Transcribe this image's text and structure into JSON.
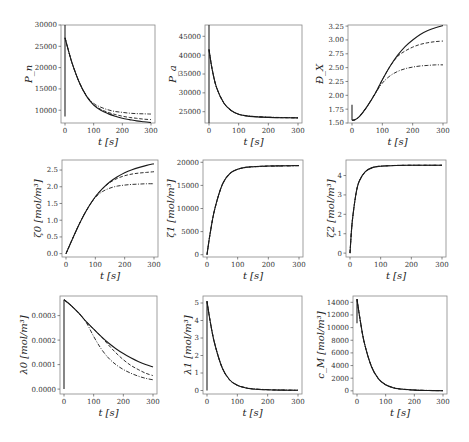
{
  "figure": {
    "caption_visible": "",
    "line_styles_legend": [
      "solid",
      "dashed",
      "dash-dot"
    ]
  },
  "chart_data": [
    {
      "type": "line",
      "panel": "row1-col1",
      "title": "",
      "xlabel": "t [s]",
      "ylabel": "P_n",
      "xlim": [
        0,
        300
      ],
      "ylim": [
        7000,
        30000
      ],
      "xticks": [
        0,
        100,
        200,
        300
      ],
      "yticks": [
        10000,
        15000,
        20000,
        25000,
        30000
      ],
      "grid": false,
      "initial_spike": [
        8500,
        30000
      ],
      "series": [
        {
          "name": "solid",
          "style": "solid",
          "x": [
            0,
            10,
            25,
            50,
            75,
            100,
            125,
            150,
            175,
            200,
            225,
            250,
            275,
            300
          ],
          "y": [
            27000,
            24500,
            21000,
            16500,
            13300,
            11200,
            10000,
            9200,
            8600,
            8100,
            7800,
            7500,
            7300,
            7100
          ]
        },
        {
          "name": "dashed",
          "style": "dashed",
          "x": [
            0,
            10,
            25,
            50,
            75,
            100,
            125,
            150,
            175,
            200,
            225,
            250,
            275,
            300
          ],
          "y": [
            27000,
            24500,
            21000,
            16500,
            13300,
            11300,
            10200,
            9500,
            9000,
            8600,
            8300,
            8100,
            7900,
            7800
          ]
        },
        {
          "name": "dash-dot",
          "style": "dashdot",
          "x": [
            0,
            10,
            25,
            50,
            75,
            100,
            125,
            150,
            175,
            200,
            225,
            250,
            275,
            300
          ],
          "y": [
            27000,
            24500,
            21000,
            16500,
            13400,
            11600,
            10700,
            10100,
            9700,
            9500,
            9300,
            9200,
            9150,
            9100
          ]
        }
      ]
    },
    {
      "type": "line",
      "panel": "row1-col2",
      "title": "",
      "xlabel": "t [s]",
      "ylabel": "P_a",
      "xlim": [
        0,
        300
      ],
      "ylim": [
        22000,
        48000
      ],
      "xticks": [
        0,
        100,
        200,
        300
      ],
      "yticks": [
        25000,
        30000,
        35000,
        40000,
        45000
      ],
      "grid": false,
      "initial_spike": [
        22000,
        48000
      ],
      "series": [
        {
          "name": "solid",
          "style": "solid",
          "x": [
            0,
            10,
            25,
            50,
            75,
            100,
            125,
            150,
            200,
            250,
            300
          ],
          "y": [
            41500,
            36500,
            31500,
            27300,
            25300,
            24300,
            23900,
            23700,
            23500,
            23400,
            23350
          ]
        },
        {
          "name": "dashed",
          "style": "dashed",
          "x": [
            0,
            10,
            25,
            50,
            75,
            100,
            125,
            150,
            200,
            250,
            300
          ],
          "y": [
            41500,
            36500,
            31500,
            27300,
            25300,
            24300,
            23900,
            23700,
            23500,
            23400,
            23350
          ]
        },
        {
          "name": "dash-dot",
          "style": "dashdot",
          "x": [
            0,
            10,
            25,
            50,
            75,
            100,
            125,
            150,
            200,
            250,
            300
          ],
          "y": [
            41500,
            36500,
            31500,
            27300,
            25300,
            24300,
            23950,
            23750,
            23550,
            23450,
            23400
          ]
        }
      ]
    },
    {
      "type": "line",
      "panel": "row1-col3",
      "title": "",
      "xlabel": "t [s]",
      "ylabel": "Đ_X",
      "xlim": [
        0,
        300
      ],
      "ylim": [
        1.5,
        3.27
      ],
      "xticks": [
        0,
        100,
        200,
        300
      ],
      "yticks": [
        1.5,
        1.75,
        2.0,
        2.25,
        2.5,
        2.75,
        3.0,
        3.25
      ],
      "grid": false,
      "initial_spike": [
        1.55,
        1.83
      ],
      "series": [
        {
          "name": "solid",
          "style": "solid",
          "x": [
            0,
            10,
            25,
            50,
            75,
            100,
            125,
            150,
            175,
            200,
            225,
            250,
            275,
            300
          ],
          "y": [
            1.55,
            1.56,
            1.62,
            1.8,
            2.02,
            2.28,
            2.52,
            2.72,
            2.88,
            3.0,
            3.1,
            3.17,
            3.22,
            3.26
          ]
        },
        {
          "name": "dashed",
          "style": "dashed",
          "x": [
            0,
            10,
            25,
            50,
            75,
            100,
            125,
            150,
            175,
            200,
            225,
            250,
            275,
            300
          ],
          "y": [
            1.55,
            1.56,
            1.62,
            1.8,
            2.02,
            2.28,
            2.52,
            2.7,
            2.8,
            2.87,
            2.92,
            2.95,
            2.97,
            2.98
          ]
        },
        {
          "name": "dash-dot",
          "style": "dashdot",
          "x": [
            0,
            10,
            25,
            50,
            75,
            100,
            125,
            150,
            175,
            200,
            225,
            250,
            275,
            300
          ],
          "y": [
            1.55,
            1.56,
            1.62,
            1.8,
            2.02,
            2.22,
            2.35,
            2.43,
            2.48,
            2.51,
            2.53,
            2.54,
            2.55,
            2.55
          ]
        }
      ]
    },
    {
      "type": "line",
      "panel": "row2-col1",
      "title": "",
      "xlabel": "t [s]",
      "ylabel": "ζ0 [mol/m³]",
      "xlim": [
        0,
        300
      ],
      "ylim": [
        -0.1,
        2.8
      ],
      "xticks": [
        0,
        100,
        200,
        300
      ],
      "yticks": [
        0.0,
        0.5,
        1.0,
        1.5,
        2.0,
        2.5
      ],
      "grid": false,
      "series": [
        {
          "name": "solid",
          "style": "solid",
          "x": [
            0,
            25,
            50,
            75,
            100,
            125,
            150,
            175,
            200,
            225,
            250,
            275,
            300
          ],
          "y": [
            0.0,
            0.5,
            0.97,
            1.37,
            1.7,
            1.95,
            2.15,
            2.3,
            2.42,
            2.51,
            2.58,
            2.64,
            2.69
          ]
        },
        {
          "name": "dashed",
          "style": "dashed",
          "x": [
            0,
            25,
            50,
            75,
            100,
            125,
            150,
            175,
            200,
            225,
            250,
            275,
            300
          ],
          "y": [
            0.0,
            0.5,
            0.97,
            1.37,
            1.7,
            1.95,
            2.13,
            2.25,
            2.33,
            2.38,
            2.41,
            2.43,
            2.45
          ]
        },
        {
          "name": "dash-dot",
          "style": "dashdot",
          "x": [
            0,
            25,
            50,
            75,
            100,
            125,
            150,
            175,
            200,
            225,
            250,
            275,
            300
          ],
          "y": [
            0.0,
            0.5,
            0.97,
            1.37,
            1.68,
            1.86,
            1.96,
            2.02,
            2.05,
            2.07,
            2.08,
            2.09,
            2.09
          ]
        }
      ]
    },
    {
      "type": "line",
      "panel": "row2-col2",
      "title": "",
      "xlabel": "t [s]",
      "ylabel": "ζ1 [mol/m³]",
      "xlim": [
        0,
        300
      ],
      "ylim": [
        -500,
        20500
      ],
      "xticks": [
        0,
        100,
        200,
        300
      ],
      "yticks": [
        0,
        5000,
        10000,
        15000,
        20000
      ],
      "grid": false,
      "series": [
        {
          "name": "solid",
          "style": "solid",
          "x": [
            0,
            10,
            25,
            50,
            75,
            100,
            125,
            150,
            200,
            250,
            300
          ],
          "y": [
            0,
            4500,
            9800,
            15200,
            17600,
            18500,
            18900,
            19050,
            19200,
            19250,
            19300
          ]
        },
        {
          "name": "dashed",
          "style": "dashed",
          "x": [
            0,
            10,
            25,
            50,
            75,
            100,
            125,
            150,
            200,
            250,
            300
          ],
          "y": [
            0,
            4500,
            9800,
            15200,
            17600,
            18500,
            18900,
            19050,
            19200,
            19250,
            19300
          ]
        },
        {
          "name": "dash-dot",
          "style": "dashdot",
          "x": [
            0,
            10,
            25,
            50,
            75,
            100,
            125,
            150,
            200,
            250,
            300
          ],
          "y": [
            0,
            4500,
            9800,
            15200,
            17600,
            18500,
            18850,
            19000,
            19150,
            19200,
            19250
          ]
        }
      ]
    },
    {
      "type": "line",
      "panel": "row2-col3",
      "title": "",
      "xlabel": "t [s]",
      "ylabel": "ζ2 [mol/m³]",
      "xlim": [
        0,
        300
      ],
      "ylim": [
        -0.2,
        4.8
      ],
      "xticks": [
        0,
        100,
        200,
        300
      ],
      "yticks": [
        0,
        1,
        2,
        3,
        4
      ],
      "grid": false,
      "series": [
        {
          "name": "solid",
          "style": "solid",
          "x": [
            0,
            5,
            10,
            20,
            30,
            50,
            75,
            100,
            150,
            200,
            250,
            300
          ],
          "y": [
            0.0,
            1.2,
            2.0,
            3.1,
            3.7,
            4.2,
            4.42,
            4.48,
            4.52,
            4.53,
            4.53,
            4.53
          ]
        },
        {
          "name": "dashed",
          "style": "dashed",
          "x": [
            0,
            5,
            10,
            20,
            30,
            50,
            75,
            100,
            150,
            200,
            250,
            300
          ],
          "y": [
            0.0,
            1.2,
            2.0,
            3.1,
            3.7,
            4.2,
            4.42,
            4.48,
            4.52,
            4.53,
            4.53,
            4.53
          ]
        },
        {
          "name": "dash-dot",
          "style": "dashdot",
          "x": [
            0,
            5,
            10,
            20,
            30,
            50,
            75,
            100,
            150,
            200,
            250,
            300
          ],
          "y": [
            0.0,
            1.2,
            2.0,
            3.1,
            3.7,
            4.2,
            4.42,
            4.48,
            4.52,
            4.53,
            4.53,
            4.53
          ]
        }
      ]
    },
    {
      "type": "line",
      "panel": "row3-col1",
      "title": "",
      "xlabel": "t [s]",
      "ylabel": "λ0 [mol/m³]",
      "xlim": [
        0,
        300
      ],
      "ylim": [
        -2e-05,
        0.00038
      ],
      "xticks": [
        0,
        100,
        200,
        300
      ],
      "yticks": [
        0.0,
        0.0001,
        0.0002,
        0.0003
      ],
      "ytick_labels": [
        "0.0000",
        "0.0001",
        "0.0002",
        "0.0003"
      ],
      "grid": false,
      "initial_spike": [
        0.0,
        0.000365
      ],
      "series": [
        {
          "name": "solid",
          "style": "solid",
          "x": [
            0,
            25,
            50,
            75,
            100,
            125,
            150,
            175,
            200,
            225,
            250,
            275,
            300
          ],
          "y": [
            0.000365,
            0.00034,
            0.00031,
            0.000275,
            0.000245,
            0.000215,
            0.000188,
            0.000165,
            0.000145,
            0.000128,
            0.000113,
            0.0001,
            9e-05
          ]
        },
        {
          "name": "dashed",
          "style": "dashed",
          "x": [
            0,
            25,
            50,
            75,
            100,
            125,
            150,
            175,
            200,
            225,
            250,
            275,
            300
          ],
          "y": [
            0.000365,
            0.00034,
            0.00031,
            0.000275,
            0.000245,
            0.000215,
            0.00018,
            0.000148,
            0.00012,
            9.7e-05,
            8e-05,
            6.5e-05,
            5.5e-05
          ]
        },
        {
          "name": "dash-dot",
          "style": "dashdot",
          "x": [
            0,
            25,
            50,
            75,
            100,
            125,
            150,
            175,
            200,
            225,
            250,
            275,
            300
          ],
          "y": [
            0.000365,
            0.00034,
            0.00031,
            0.000272,
            0.000215,
            0.000165,
            0.000127,
            0.0001,
            8e-05,
            6.5e-05,
            5.3e-05,
            4.4e-05,
            3.8e-05
          ]
        }
      ]
    },
    {
      "type": "line",
      "panel": "row3-col2",
      "title": "",
      "xlabel": "t [s]",
      "ylabel": "λ1 [mol/m³]",
      "xlim": [
        0,
        300
      ],
      "ylim": [
        -0.2,
        5.4
      ],
      "xticks": [
        0,
        100,
        200,
        300
      ],
      "yticks": [
        0,
        1,
        2,
        3,
        4,
        5
      ],
      "grid": false,
      "initial_spike": [
        0.0,
        5.1
      ],
      "series": [
        {
          "name": "solid",
          "style": "solid",
          "x": [
            0,
            10,
            25,
            50,
            75,
            100,
            125,
            150,
            200,
            250,
            300
          ],
          "y": [
            5.1,
            4.0,
            2.7,
            1.3,
            0.6,
            0.3,
            0.16,
            0.09,
            0.04,
            0.02,
            0.01
          ]
        },
        {
          "name": "dashed",
          "style": "dashed",
          "x": [
            0,
            10,
            25,
            50,
            75,
            100,
            125,
            150,
            200,
            250,
            300
          ],
          "y": [
            5.1,
            4.0,
            2.7,
            1.3,
            0.6,
            0.3,
            0.16,
            0.09,
            0.04,
            0.02,
            0.01
          ]
        },
        {
          "name": "dash-dot",
          "style": "dashdot",
          "x": [
            0,
            10,
            25,
            50,
            75,
            100,
            125,
            150,
            200,
            250,
            300
          ],
          "y": [
            5.1,
            4.0,
            2.7,
            1.3,
            0.6,
            0.3,
            0.17,
            0.1,
            0.05,
            0.03,
            0.02
          ]
        }
      ]
    },
    {
      "type": "line",
      "panel": "row3-col3",
      "title": "",
      "xlabel": "t [s]",
      "ylabel": "c_M [mol/m³]",
      "xlim": [
        0,
        300
      ],
      "ylim": [
        -500,
        15000
      ],
      "xticks": [
        0,
        100,
        200,
        300
      ],
      "yticks": [
        0,
        2000,
        4000,
        6000,
        8000,
        10000,
        12000,
        14000
      ],
      "grid": false,
      "initial_spike": [
        10700,
        14500
      ],
      "series": [
        {
          "name": "solid",
          "style": "solid",
          "x": [
            0,
            10,
            25,
            50,
            75,
            100,
            125,
            150,
            200,
            250,
            300
          ],
          "y": [
            14500,
            11500,
            7700,
            3900,
            1900,
            950,
            500,
            280,
            110,
            50,
            20
          ]
        },
        {
          "name": "dashed",
          "style": "dashed",
          "x": [
            0,
            10,
            25,
            50,
            75,
            100,
            125,
            150,
            200,
            250,
            300
          ],
          "y": [
            14500,
            11500,
            7700,
            3900,
            1900,
            950,
            500,
            280,
            110,
            50,
            20
          ]
        },
        {
          "name": "dash-dot",
          "style": "dashdot",
          "x": [
            0,
            10,
            25,
            50,
            75,
            100,
            125,
            150,
            200,
            250,
            300
          ],
          "y": [
            14500,
            11500,
            7700,
            3900,
            1900,
            980,
            540,
            320,
            140,
            70,
            35
          ]
        }
      ]
    }
  ]
}
